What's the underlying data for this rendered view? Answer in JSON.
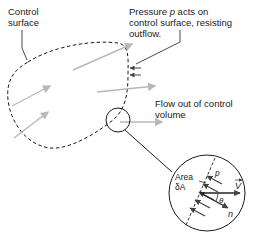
{
  "labels": {
    "control_surface_line1": "Control",
    "control_surface_line2": "surface",
    "pressure_line1_pre": "Pressure ",
    "pressure_symbol": "p",
    "pressure_line1_post": " acts on",
    "pressure_line2": "control surface, resisting",
    "pressure_line3": "outflow.",
    "flow_out_line1": "Flow out of control",
    "flow_out_line2": "volume",
    "area_line1": "Area",
    "area_line2": "δA",
    "detail_p": "p",
    "detail_V": "V",
    "detail_theta": "θ",
    "detail_n": "n"
  },
  "colors": {
    "outline": "#1a1a1a",
    "flow_arrow": "#b8b8b8",
    "pressure_arrow": "#555555"
  }
}
